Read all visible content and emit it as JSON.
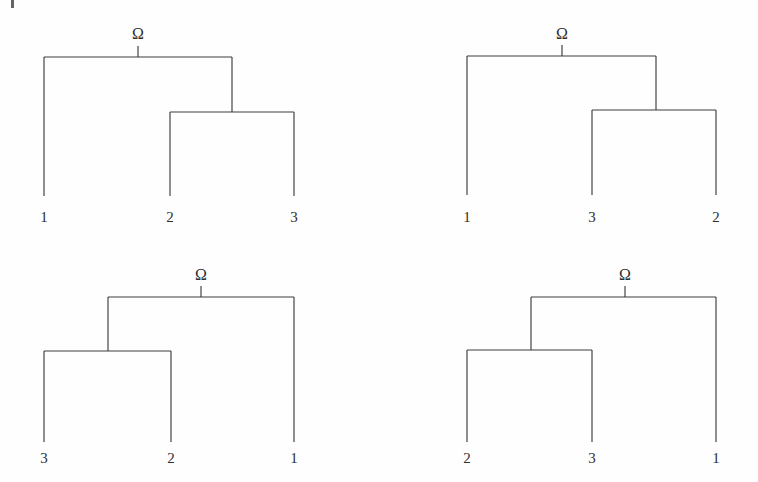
{
  "figure": {
    "background_color": "#fefefe",
    "line_color": "#3c3c3c",
    "text_color": "#2e2e2e",
    "root_symbol": "Ω",
    "artifact": {
      "name": "scan-edge-mark",
      "visible": true
    }
  },
  "trees": [
    {
      "id": "tree-top-left",
      "position": {
        "left": 0,
        "top": 0
      },
      "root_label": "Ω",
      "root_label_pos": {
        "x": 138,
        "y": 26
      },
      "leaves": [
        {
          "label": "1",
          "x": 44,
          "y": 210
        },
        {
          "label": "2",
          "x": 170,
          "y": 210
        },
        {
          "label": "3",
          "x": 294,
          "y": 210
        }
      ],
      "geometry": {
        "outer_bar_y": 57,
        "outer_left_x": 44,
        "outer_right_x": 232,
        "root_tick_x": 138,
        "root_tick_top_y": 46,
        "inner_bar_y": 112,
        "inner_left_x": 170,
        "inner_right_x": 294,
        "leaf_bottom_y": 196
      }
    },
    {
      "id": "tree-top-right",
      "position": {
        "left": 379,
        "top": 0
      },
      "root_label": "Ω",
      "root_label_pos": {
        "x": 183,
        "y": 26
      },
      "leaves": [
        {
          "label": "1",
          "x": 88,
          "y": 210
        },
        {
          "label": "3",
          "x": 213,
          "y": 210
        },
        {
          "label": "2",
          "x": 337,
          "y": 210
        }
      ],
      "geometry": {
        "outer_bar_y": 56,
        "outer_left_x": 88,
        "outer_right_x": 277,
        "root_tick_x": 183,
        "root_tick_top_y": 45,
        "inner_bar_y": 110,
        "inner_left_x": 213,
        "inner_right_x": 337,
        "leaf_bottom_y": 195
      }
    },
    {
      "id": "tree-bottom-left",
      "position": {
        "left": 0,
        "top": 241
      },
      "root_label": "Ω",
      "root_label_pos": {
        "x": 201,
        "y": 26
      },
      "leaves": [
        {
          "label": "3",
          "x": 44,
          "y": 210
        },
        {
          "label": "2",
          "x": 171,
          "y": 210
        },
        {
          "label": "1",
          "x": 294,
          "y": 210
        }
      ],
      "geometry": {
        "outer_bar_y": 56,
        "outer_left_x": 108,
        "outer_right_x": 294,
        "root_tick_x": 201,
        "root_tick_top_y": 45,
        "inner_bar_y": 110,
        "inner_left_x": 44,
        "inner_right_x": 171,
        "inner_stem_x": 108,
        "leaf_bottom_y": 201
      }
    },
    {
      "id": "tree-bottom-right",
      "position": {
        "left": 379,
        "top": 241
      },
      "root_label": "Ω",
      "root_label_pos": {
        "x": 246,
        "y": 26
      },
      "leaves": [
        {
          "label": "2",
          "x": 88,
          "y": 210
        },
        {
          "label": "3",
          "x": 213,
          "y": 210
        },
        {
          "label": "1",
          "x": 337,
          "y": 210
        }
      ],
      "geometry": {
        "outer_bar_y": 56,
        "outer_left_x": 152,
        "outer_right_x": 337,
        "root_tick_x": 246,
        "root_tick_top_y": 45,
        "inner_bar_y": 109,
        "inner_left_x": 88,
        "inner_right_x": 213,
        "inner_stem_x": 152,
        "leaf_bottom_y": 201
      }
    }
  ]
}
